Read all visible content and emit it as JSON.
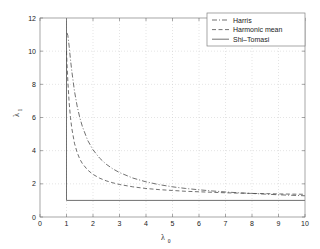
{
  "chart_data": {
    "type": "line",
    "title": "",
    "xlabel": "λ",
    "xlabel_sub": "0",
    "ylabel": "λ",
    "ylabel_sub": "1",
    "xlim": [
      0,
      10
    ],
    "ylim": [
      0,
      12
    ],
    "xticks": [
      "0",
      "1",
      "2",
      "3",
      "4",
      "5",
      "6",
      "7",
      "8",
      "9",
      "10"
    ],
    "yticks": [
      "0",
      "2",
      "4",
      "6",
      "8",
      "10",
      "12"
    ],
    "xtick_values": [
      0,
      1,
      2,
      3,
      4,
      5,
      6,
      7,
      8,
      9,
      10
    ],
    "ytick_values": [
      0,
      2,
      4,
      6,
      8,
      10,
      12
    ],
    "grid": "dotted-both-axes",
    "legend_position": "top-right",
    "background": "#ffffff",
    "axis_color": "#808080",
    "grid_color": "#c8c8c8",
    "series": [
      {
        "name": "Harris",
        "style": "dash-dot",
        "color": "#4d4d4d",
        "x": [
          1.02,
          1.05,
          1.1,
          1.15,
          1.2,
          1.3,
          1.4,
          1.5,
          1.6,
          1.8,
          2.0,
          2.25,
          2.5,
          2.75,
          3.0,
          3.5,
          4.0,
          4.5,
          5.0,
          5.5,
          6.0,
          6.5,
          7.0,
          7.5,
          8.0,
          8.5,
          9.0,
          9.5,
          10.0
        ],
        "y": [
          11.1,
          10.95,
          10.3,
          9.5,
          8.8,
          7.6,
          6.7,
          6.0,
          5.45,
          4.62,
          4.05,
          3.55,
          3.18,
          2.9,
          2.68,
          2.35,
          2.12,
          1.95,
          1.82,
          1.72,
          1.64,
          1.57,
          1.51,
          1.46,
          1.42,
          1.38,
          1.34,
          1.31,
          1.28
        ]
      },
      {
        "name": "Harmonic mean",
        "style": "dashed",
        "color": "#4d4d4d",
        "x": [
          1.0,
          1.02,
          1.05,
          1.1,
          1.15,
          1.2,
          1.3,
          1.4,
          1.5,
          1.6,
          1.8,
          2.0,
          2.25,
          2.5,
          2.75,
          3.0,
          3.5,
          4.0,
          4.5,
          5.0,
          5.5,
          6.0,
          6.5,
          7.0,
          7.5,
          8.0,
          8.5,
          9.0,
          9.5,
          10.0
        ],
        "y": [
          10.0,
          9.2,
          8.2,
          6.9,
          6.0,
          5.35,
          4.45,
          3.9,
          3.5,
          3.22,
          2.83,
          2.57,
          2.34,
          2.18,
          2.06,
          1.96,
          1.82,
          1.72,
          1.65,
          1.6,
          1.55,
          1.52,
          1.49,
          1.46,
          1.44,
          1.42,
          1.41,
          1.39,
          1.38,
          1.37
        ]
      },
      {
        "name": "Shi–Tomasi",
        "style": "solid",
        "color": "#4d4d4d",
        "x": [
          1.0,
          1.0,
          10.0
        ],
        "y": [
          12.0,
          1.0,
          1.0
        ]
      }
    ]
  },
  "legend": {
    "items": [
      {
        "label": "Harris",
        "style": "dash-dot"
      },
      {
        "label": "Harmonic mean",
        "style": "dashed"
      },
      {
        "label": "Shi–Tomasi",
        "style": "solid"
      }
    ]
  }
}
